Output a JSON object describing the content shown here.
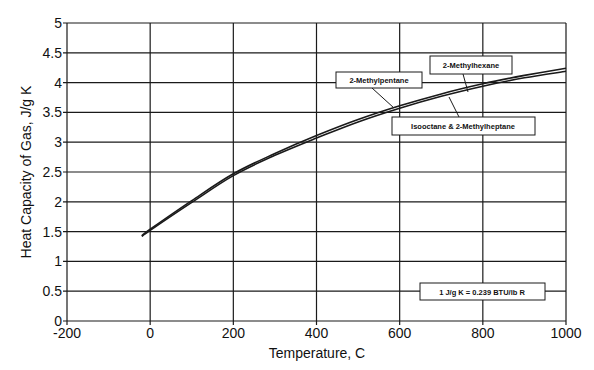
{
  "chart_data": {
    "type": "line",
    "title": "",
    "xlabel": "Temperature, C",
    "ylabel": "Heat Capacity of Gas,  J/g K",
    "xlim": [
      -200,
      1000
    ],
    "ylim": [
      0,
      5
    ],
    "xticks": [
      -200,
      0,
      200,
      400,
      600,
      800,
      1000
    ],
    "xtick_labels": [
      "-200",
      "0",
      "200",
      "400",
      "600",
      "800",
      "1000"
    ],
    "yticks": [
      0,
      0.5,
      1,
      1.5,
      2,
      2.5,
      3,
      3.5,
      4,
      4.5,
      5
    ],
    "ytick_labels": [
      "0",
      "0.5",
      "1",
      "1.5",
      "2",
      "2.5",
      "3",
      "3.5",
      "4",
      "4.5",
      "5"
    ],
    "grid": true,
    "legend": "none (inline callout labels)",
    "x": [
      -20,
      0,
      100,
      200,
      300,
      400,
      500,
      600,
      700,
      800,
      900,
      1000
    ],
    "series": [
      {
        "name": "2-Methylpentane / 2-Methylhexane",
        "values": [
          1.43,
          1.54,
          2.02,
          2.47,
          2.81,
          3.11,
          3.38,
          3.61,
          3.81,
          3.98,
          4.12,
          4.24
        ]
      },
      {
        "name": "Isooctane & 2-Methylheptane",
        "values": [
          1.42,
          1.52,
          1.99,
          2.44,
          2.78,
          3.07,
          3.34,
          3.57,
          3.77,
          3.94,
          4.08,
          4.19
        ]
      }
    ],
    "annotations": [
      {
        "text": "2-Methylpentane",
        "points_to": "upper curve near T=580"
      },
      {
        "text": "2-Methylhexane",
        "points_to": "upper curve near T=750"
      },
      {
        "text": "Isooctane & 2-Methylheptane",
        "points_to": "lower curve near T=730"
      },
      {
        "text": "1 J/g K = 0.239 BTU/lb R",
        "points_to": "conversion note"
      }
    ]
  },
  "labels": {
    "methylpentane": "2-Methylpentane",
    "methylhexane": "2-Methylhexane",
    "isooctane": "Isooctane & 2-Methylheptane",
    "conversion": "1 J/g K = 0.239 BTU/lb R"
  },
  "colors": {
    "line": "#1a1a1a",
    "grid": "#1a1a1a",
    "background": "#ffffff"
  }
}
